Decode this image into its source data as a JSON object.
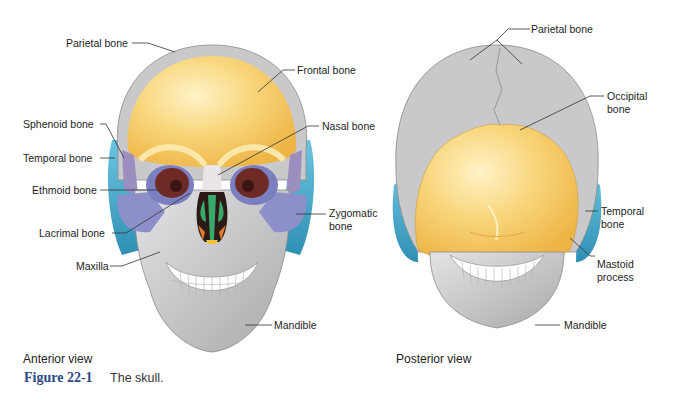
{
  "figure": {
    "number": "Figure 22-1",
    "caption": "The skull.",
    "accent_color": "#2b4a86"
  },
  "anterior": {
    "view_label": "Anterior view",
    "labels": {
      "parietal": "Parietal bone",
      "frontal": "Frontal bone",
      "sphenoid": "Sphenoid bone",
      "nasal": "Nasal bone",
      "temporal": "Temporal bone",
      "ethmoid": "Ethmoid bone",
      "zygomatic_1": "Zygomatic",
      "zygomatic_2": "bone",
      "lacrimal": "Lacrimal bone",
      "maxilla": "Maxilla",
      "mandible": "Mandible"
    }
  },
  "posterior": {
    "view_label": "Posterior view",
    "labels": {
      "parietal": "Parietal bone",
      "occipital_1": "Occipital",
      "occipital_2": "bone",
      "temporal_1": "Temporal",
      "temporal_2": "bone",
      "mastoid_1": "Mastoid",
      "mastoid_2": "process",
      "mandible": "Mandible"
    }
  },
  "colors": {
    "frontal_occipital": "#f6c766",
    "parietal_gray": "#c9c9cb",
    "temporal_blue": "#3aa7c8",
    "zygomatic_purple": "#8d8fc8",
    "orbit_maroon": "#6e2a25",
    "nasal_green": "#3aa86a",
    "lacrimal_orange": "#e27a2a"
  }
}
